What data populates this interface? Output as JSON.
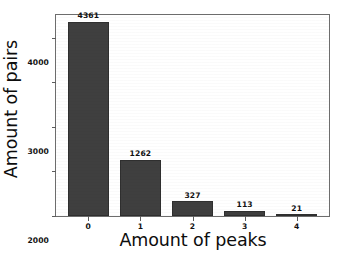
{
  "chart_data": {
    "type": "bar",
    "title": "",
    "xlabel": "Amount of peaks",
    "ylabel": "Amount of pairs",
    "categories": [
      "0",
      "1",
      "2",
      "3",
      "4"
    ],
    "values": [
      4361,
      1262,
      327,
      113,
      21
    ],
    "bar_labels": [
      "4361",
      "1262",
      "327",
      "113",
      "21"
    ],
    "yticks": [
      0,
      1000,
      2000,
      3000,
      4000
    ],
    "ytick_labels": [
      "0",
      "1000",
      "2000",
      "3000",
      "4000"
    ],
    "xtick_labels": [
      "0",
      "1",
      "2",
      "3",
      "4"
    ],
    "ylim": [
      0,
      4512
    ],
    "xlim": [
      -0.62,
      4.62
    ],
    "grid": false,
    "legend": null,
    "legend_position": "none",
    "series": [
      {
        "name": "Amount of pairs",
        "values": [
          4361,
          1262,
          327,
          113,
          21
        ]
      }
    ],
    "colors": {
      "bar": "#3f3f3f",
      "bar_edge": "#2f2f2f",
      "axis": "#6d6d6d",
      "tick": "#5c5c5c",
      "text": "#111111",
      "background": "#ffffff"
    }
  }
}
